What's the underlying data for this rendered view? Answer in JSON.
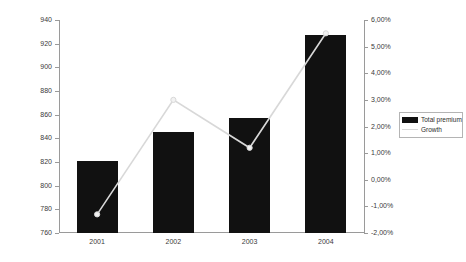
{
  "chart_data": {
    "type": "bar",
    "title": "",
    "subtitle": "",
    "xlabel": "",
    "ylabel": "",
    "categories": [
      "2001",
      "2002",
      "2003",
      "2004"
    ],
    "grid": false,
    "legend_position": "right",
    "series": [
      {
        "name": "Total premium",
        "type": "bar",
        "axis": "left",
        "color": "#111111",
        "values": [
          821,
          845,
          857,
          927
        ]
      },
      {
        "name": "Growth",
        "type": "line",
        "axis": "right",
        "color": "#d8d8d8",
        "values": [
          -1.3,
          3.0,
          1.2,
          5.5
        ],
        "value_labels": [
          "-1,30%",
          "3,00%",
          "1,20%",
          "5,50%"
        ]
      }
    ],
    "left_axis": {
      "min": 760,
      "max": 940,
      "step": 20,
      "ticks": [
        760,
        780,
        800,
        820,
        840,
        860,
        880,
        900,
        920,
        940
      ],
      "tick_labels": [
        "760",
        "780",
        "800",
        "820",
        "840",
        "860",
        "880",
        "900",
        "920",
        "940"
      ]
    },
    "right_axis": {
      "min": -2.0,
      "max": 6.0,
      "step": 1.0,
      "ticks": [
        -2.0,
        -1.0,
        0.0,
        1.0,
        2.0,
        3.0,
        4.0,
        5.0,
        6.0
      ],
      "tick_labels": [
        "-2,00%",
        "-1,00%",
        "0,00%",
        "1,00%",
        "2,00%",
        "3,00%",
        "4,00%",
        "5,00%",
        "6,00%"
      ]
    }
  },
  "legend": {
    "items": [
      {
        "label": "Total premium",
        "swatch": "bar-swatch"
      },
      {
        "label": "Growth",
        "swatch": "line-swatch"
      }
    ]
  }
}
